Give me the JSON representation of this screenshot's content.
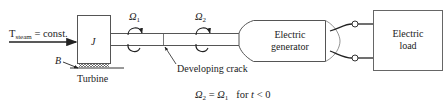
{
  "diagram": {
    "input": {
      "label_main": "T",
      "label_sub": "steam",
      "label_rest": " = const."
    },
    "turbine": {
      "inertia_label": "J",
      "bearing_label": "B",
      "caption": "Turbine"
    },
    "shaft": {
      "omega1": {
        "symbol": "Ω",
        "sub": "1"
      },
      "omega2": {
        "symbol": "Ω",
        "sub": "2"
      },
      "crack_label": "Developing crack"
    },
    "generator": {
      "line1": "Electric",
      "line2": "generator"
    },
    "load": {
      "line1": "Electric",
      "line2": "load"
    },
    "condition": {
      "lhs_symbol": "Ω",
      "lhs_sub": "2",
      "eq": " = ",
      "rhs_symbol": "Ω",
      "rhs_sub": "1",
      "rest": "   for ",
      "var": "t",
      "tail": " < 0"
    },
    "colors": {
      "stroke": "#333333",
      "text": "#222222",
      "background": "#ffffff"
    }
  }
}
